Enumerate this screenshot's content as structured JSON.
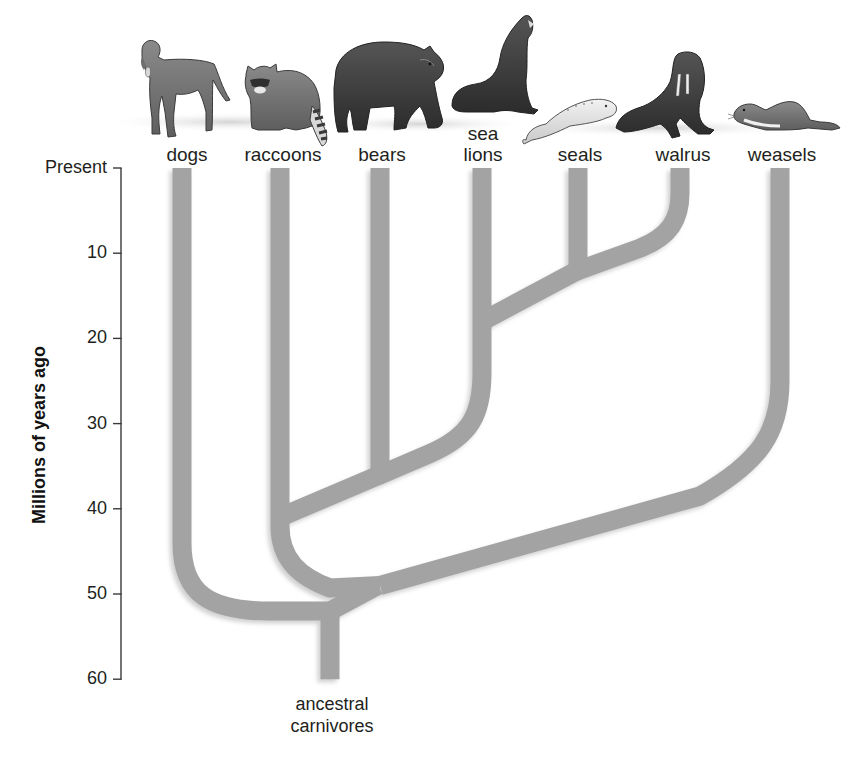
{
  "figure": {
    "type": "phylogenetic-tree",
    "title": "",
    "axis": {
      "title": "Millions of years ago",
      "ticks": [
        {
          "label": "Present",
          "value": 0
        },
        {
          "label": "10",
          "value": 10
        },
        {
          "label": "20",
          "value": 20
        },
        {
          "label": "30",
          "value": 30
        },
        {
          "label": "40",
          "value": 40
        },
        {
          "label": "50",
          "value": 50
        },
        {
          "label": "60",
          "value": 60
        }
      ],
      "range": [
        0,
        60
      ]
    },
    "taxa": [
      {
        "id": "dogs",
        "label": "dogs",
        "animal": "dog-illustration"
      },
      {
        "id": "raccoons",
        "label": "raccoons",
        "animal": "raccoon-illustration"
      },
      {
        "id": "bears",
        "label": "bears",
        "animal": "bear-illustration"
      },
      {
        "id": "sea_lions",
        "label": "sea\nlions",
        "animal": "sea-lion-illustration"
      },
      {
        "id": "seals",
        "label": "seals",
        "animal": "seal-illustration"
      },
      {
        "id": "walrus",
        "label": "walrus",
        "animal": "walrus-illustration"
      },
      {
        "id": "weasels",
        "label": "weasels",
        "animal": "weasel-illustration"
      }
    ],
    "root_label": "ancestral\ncarnivores",
    "divergences_mya": [
      {
        "split": [
          "dogs",
          "all other carnivores"
        ],
        "approx_mya": 52
      },
      {
        "split": [
          "weasels",
          "raccoons + bears + pinnipeds"
        ],
        "approx_mya": 49
      },
      {
        "split": [
          "raccoons",
          "bears + pinnipeds"
        ],
        "approx_mya": 41
      },
      {
        "split": [
          "bears",
          "pinnipeds"
        ],
        "approx_mya": 36
      },
      {
        "split": [
          "sea lions",
          "seals + walrus"
        ],
        "approx_mya": 18
      },
      {
        "split": [
          "seals",
          "walrus"
        ],
        "approx_mya": 12
      }
    ],
    "root_origin_mya": 60,
    "colors": {
      "branch": "#a3a3a3",
      "branch_shadow": "#d0d0d0",
      "axis": "#3a3a3a",
      "text": "#231f20"
    }
  }
}
